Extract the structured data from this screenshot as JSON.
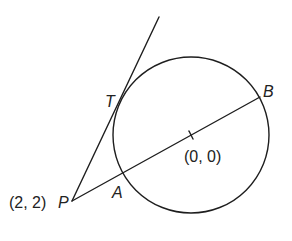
{
  "diagram": {
    "type": "geometry",
    "circle": {
      "center_label": "(0, 0)",
      "center_px": [
        191,
        135
      ],
      "radius_px": 78
    },
    "points": {
      "P": {
        "label": "P",
        "coord_label": "(2, 2)",
        "px": [
          72,
          201
        ]
      },
      "T": {
        "label": "T",
        "px": [
          122,
          93
        ]
      },
      "A": {
        "label": "A",
        "px": [
          123,
          173
        ]
      },
      "B": {
        "label": "B",
        "px": [
          260,
          97
        ]
      }
    },
    "lines": [
      {
        "name": "tangent-PT",
        "from": "P",
        "through": "T",
        "end_px": [
          159,
          17
        ]
      },
      {
        "name": "secant-PB",
        "from": "P",
        "through": "A",
        "to": "B"
      }
    ],
    "colors": {
      "stroke": "#1e1e1e",
      "text": "#222222",
      "background": "#ffffff"
    }
  }
}
